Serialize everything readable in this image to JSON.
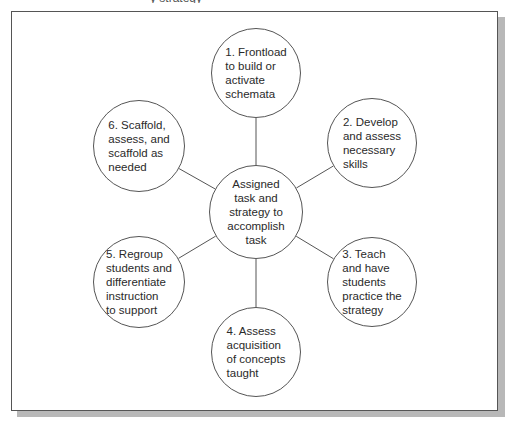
{
  "caption": {
    "fragment": "y strategy"
  },
  "colors": {
    "stroke": "#555555",
    "shadow": "#b8b8b8",
    "text": "#2a2a2a",
    "background": "#ffffff"
  },
  "diagram": {
    "type": "hub-and-spoke",
    "center": {
      "id": "center",
      "label": "Assigned\ntask and\nstrategy to\naccomplish\ntask",
      "cx": 256,
      "cy": 212,
      "r": 47
    },
    "nodes": [
      {
        "id": "step-1",
        "label": "1. Frontload\nto build or\nactivate\nschemata",
        "cx": 256,
        "cy": 73,
        "r": 45
      },
      {
        "id": "step-2",
        "label": "2. Develop\nand assess\nnecessary\nskills",
        "cx": 372,
        "cy": 143,
        "r": 45
      },
      {
        "id": "step-3",
        "label": "3. Teach\nand have\nstudents\npractice the\nstrategy",
        "cx": 372,
        "cy": 282,
        "r": 45
      },
      {
        "id": "step-4",
        "label": "4. Assess\nacquisition\nof concepts\ntaught",
        "cx": 256,
        "cy": 352,
        "r": 45
      },
      {
        "id": "step-5",
        "label": "5. Regroup\nstudents and\ndifferentiate\ninstruction\nto support",
        "cx": 139,
        "cy": 282,
        "r": 46
      },
      {
        "id": "step-6",
        "label": "6. Scaffold,\nassess, and\nscaffold as\nneeded",
        "cx": 139,
        "cy": 146,
        "r": 46
      }
    ],
    "edges": [
      {
        "from": "center",
        "to": "step-1"
      },
      {
        "from": "center",
        "to": "step-2"
      },
      {
        "from": "center",
        "to": "step-3"
      },
      {
        "from": "center",
        "to": "step-4"
      },
      {
        "from": "center",
        "to": "step-5"
      },
      {
        "from": "center",
        "to": "step-6"
      }
    ]
  }
}
